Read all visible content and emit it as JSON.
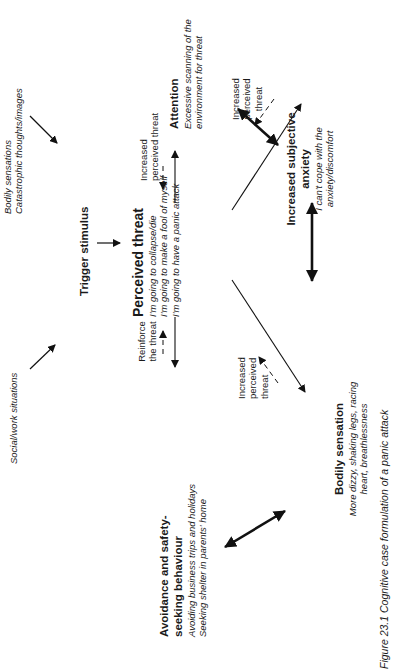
{
  "diagram": {
    "nodes": {
      "social": {
        "label": "Social/work situations"
      },
      "bodily_triggers": {
        "line1": "Bodily sensations",
        "line2": "Catastrophic thoughts/images"
      },
      "trigger": {
        "label": "Trigger stimulus"
      },
      "perceived": {
        "title": "Perceived threat",
        "lines": [
          "I'm going to collapse/die",
          "I'm going to make a fool of myself",
          "I'm going to have a panic attack"
        ]
      },
      "attention": {
        "title": "Attention",
        "line1": "Excessive scanning of the",
        "line2": "environment for threat"
      },
      "anxiety": {
        "title1": "Increased subjective",
        "title2": "anxiety",
        "line1": "I can't cope with the",
        "line2": "anxiety/discomfort"
      },
      "avoidance": {
        "title1": "Avoidance and safety-",
        "title2": "seeking behaviour",
        "line1": "Avoiding business trips and holidays",
        "line2": "Seeking shelter in parents' home"
      },
      "bodily": {
        "title": "Bodily sensation",
        "line1": "More dizzy, shaking legs, racing",
        "line2": "heart, breathlessness"
      }
    },
    "edge_labels": {
      "attention_feedback": {
        "line1": "Increased",
        "line2": "perceived threat"
      },
      "anxiety_feedback": {
        "line1": "Increased",
        "line2": "perceived",
        "line3": "threat"
      },
      "avoidance_feedback": {
        "line1": "Reinforce",
        "line2": "the threat"
      },
      "bodily_feedback": {
        "line1": "Increased",
        "line2": "perceived",
        "line3": "threat"
      }
    },
    "caption": "Figure 23.1 Cognitive case formulation of a panic attack"
  }
}
